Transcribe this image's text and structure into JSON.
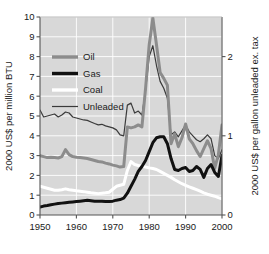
{
  "chart_data": {
    "type": "line",
    "title": "",
    "subtitle": "",
    "xlabel": "",
    "ylabel": "2000 US$ per million BTU",
    "ylabel_right": "2000 US$ per gallon unleaded ex. tax",
    "xlim": [
      1950,
      2000
    ],
    "ylim": [
      0,
      10
    ],
    "ylim_right": [
      0,
      2.5
    ],
    "grid": true,
    "legend_position": "upper-left-inside",
    "background": "#d8d8d8",
    "gridline_color": "#ffffff",
    "xticks": [
      1950,
      1960,
      1970,
      1980,
      1990,
      2000
    ],
    "xtick_labels": [
      "1950",
      "1960",
      "1970",
      "1980",
      "1990",
      "2000"
    ],
    "yticks": [
      0,
      1,
      2,
      3,
      4,
      5,
      6,
      7,
      8,
      9,
      10
    ],
    "ytick_labels": [
      "0",
      "1",
      "2",
      "3",
      "4",
      "5",
      "6",
      "7",
      "8",
      "9",
      "10"
    ],
    "yticks_right": [
      0,
      1,
      2
    ],
    "ytick_labels_right": [
      "0",
      "1",
      "2"
    ],
    "x": [
      1950,
      1951,
      1952,
      1953,
      1954,
      1955,
      1956,
      1957,
      1958,
      1959,
      1960,
      1961,
      1962,
      1963,
      1964,
      1965,
      1966,
      1967,
      1968,
      1969,
      1970,
      1971,
      1972,
      1973,
      1974,
      1975,
      1976,
      1977,
      1978,
      1979,
      1980,
      1981,
      1982,
      1983,
      1984,
      1985,
      1986,
      1987,
      1988,
      1989,
      1990,
      1991,
      1992,
      1993,
      1994,
      1995,
      1996,
      1997,
      1998,
      1999,
      2000
    ],
    "series": [
      {
        "name": "Oil",
        "color": "#8c8c8c",
        "width": 3.0,
        "axis": "left",
        "values": [
          3.0,
          2.95,
          2.9,
          2.92,
          2.9,
          2.88,
          2.95,
          3.3,
          3.05,
          2.95,
          2.92,
          2.9,
          2.88,
          2.85,
          2.8,
          2.75,
          2.7,
          2.68,
          2.62,
          2.58,
          2.52,
          2.48,
          2.42,
          2.45,
          4.45,
          4.4,
          4.45,
          4.55,
          4.45,
          6.4,
          8.6,
          9.95,
          8.6,
          7.2,
          6.9,
          6.55,
          3.6,
          4.1,
          3.45,
          3.9,
          4.6,
          3.85,
          3.6,
          3.25,
          2.95,
          3.35,
          3.75,
          3.35,
          2.35,
          3.05,
          4.55
        ]
      },
      {
        "name": "Gas",
        "color": "#111111",
        "width": 3.0,
        "axis": "left",
        "values": [
          0.4,
          0.45,
          0.48,
          0.52,
          0.55,
          0.58,
          0.6,
          0.62,
          0.64,
          0.66,
          0.68,
          0.7,
          0.72,
          0.74,
          0.72,
          0.7,
          0.7,
          0.7,
          0.68,
          0.68,
          0.7,
          0.75,
          0.78,
          0.85,
          1.1,
          1.45,
          1.8,
          2.2,
          2.45,
          2.75,
          3.2,
          3.65,
          3.9,
          3.95,
          3.95,
          3.6,
          2.85,
          2.3,
          2.25,
          2.35,
          2.4,
          2.2,
          2.25,
          2.45,
          2.3,
          1.9,
          2.35,
          2.55,
          2.15,
          1.95,
          3.0
        ]
      },
      {
        "name": "Coal",
        "color": "#ffffff",
        "width": 3.0,
        "axis": "left",
        "values": [
          1.45,
          1.4,
          1.35,
          1.3,
          1.25,
          1.25,
          1.28,
          1.32,
          1.28,
          1.25,
          1.22,
          1.2,
          1.18,
          1.15,
          1.12,
          1.1,
          1.08,
          1.1,
          1.12,
          1.15,
          1.3,
          1.45,
          1.5,
          1.55,
          2.25,
          2.7,
          2.55,
          2.5,
          2.48,
          2.42,
          2.38,
          2.35,
          2.3,
          2.2,
          2.1,
          2.0,
          1.9,
          1.78,
          1.68,
          1.58,
          1.5,
          1.42,
          1.35,
          1.28,
          1.2,
          1.12,
          1.05,
          1.0,
          0.95,
          0.88,
          0.82
        ]
      },
      {
        "name": "Unleaded",
        "color": "#3a3a3a",
        "width": 1.2,
        "axis": "left",
        "values": [
          5.3,
          4.95,
          5.0,
          5.05,
          5.1,
          4.95,
          5.05,
          5.2,
          5.15,
          4.95,
          4.9,
          4.85,
          4.8,
          4.78,
          4.7,
          4.62,
          4.55,
          4.58,
          4.5,
          4.45,
          4.4,
          4.3,
          4.05,
          4.0,
          5.55,
          5.65,
          5.15,
          5.25,
          5.05,
          6.3,
          8.0,
          8.55,
          7.55,
          6.75,
          6.4,
          5.9,
          4.05,
          4.2,
          3.95,
          4.25,
          4.55,
          4.2,
          4.0,
          3.8,
          3.7,
          3.85,
          4.05,
          3.85,
          3.0,
          2.85,
          3.3
        ]
      }
    ],
    "legend": [
      {
        "label": "Oil",
        "color": "#8c8c8c",
        "width": 3.4
      },
      {
        "label": "Gas",
        "color": "#111111",
        "width": 3.4
      },
      {
        "label": "Coal",
        "color": "#ffffff",
        "width": 3.4
      },
      {
        "label": "Unleaded",
        "color": "#3a3a3a",
        "width": 1.2
      }
    ]
  }
}
